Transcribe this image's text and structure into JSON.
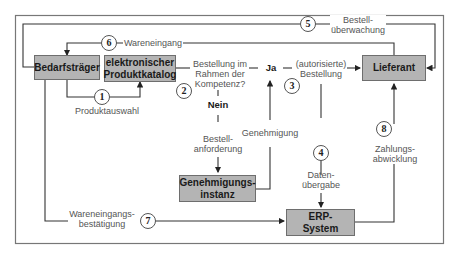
{
  "diagram": {
    "nodes": {
      "bedarfstraeger": "Bedarfsträger",
      "katalog_line1": "elektronischer",
      "katalog_line2": "Produktkatalog",
      "lieferant": "Lieferant",
      "genehmigung_line1": "Genehmigungs-",
      "genehmigung_line2": "instanz",
      "erp_line1": "ERP-",
      "erp_line2": "System"
    },
    "decision": {
      "q_line1": "Bestellung im",
      "q_line2": "Rahmen der",
      "q_line3": "Kompetenz?",
      "yes": "Ja",
      "no": "Nein"
    },
    "labels": {
      "produktauswahl": "Produktauswahl",
      "wareneingang": "Wareneingang",
      "bestellueberwachung_line1": "Bestell-",
      "bestellueberwachung_line2": "überwachung",
      "autorisierte_line1": "(autorisierte)",
      "autorisierte_line2": "Bestellung",
      "bestellanforderung_line1": "Bestell-",
      "bestellanforderung_line2": "anforderung",
      "genehmigung": "Genehmigung",
      "datenuebergabe_line1": "Daten-",
      "datenuebergabe_line2": "übergabe",
      "zahlung_line1": "Zahlungs-",
      "zahlung_line2": "abwicklung",
      "web_line1": "Wareneingangs-",
      "web_line2": "bestätigung"
    },
    "steps": [
      "1",
      "2",
      "3",
      "4",
      "5",
      "6",
      "7",
      "8"
    ],
    "colors": {
      "box_fill": "#b4b4b4",
      "line": "#333333",
      "text_gray": "#555555"
    }
  }
}
